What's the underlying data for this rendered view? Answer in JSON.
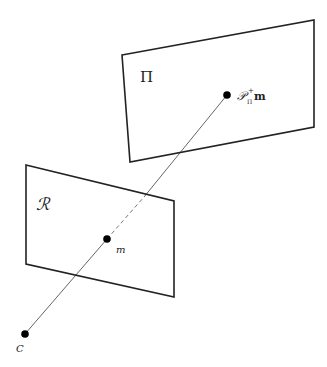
{
  "diagram": {
    "planes": [
      {
        "id": "pi",
        "label": "Π",
        "corners": [
          [
            122,
            55
          ],
          [
            314,
            20
          ],
          [
            314,
            127
          ],
          [
            130,
            162
          ]
        ],
        "label_pos": [
          140,
          82
        ]
      },
      {
        "id": "r",
        "label": "ℛ",
        "corners": [
          [
            26,
            165
          ],
          [
            174,
            201
          ],
          [
            174,
            297
          ],
          [
            26,
            264
          ]
        ],
        "label_pos": [
          38,
          206
        ]
      }
    ],
    "points": [
      {
        "id": "c",
        "label": "C",
        "pos": [
          25,
          334
        ],
        "label_pos": [
          16,
          352
        ]
      },
      {
        "id": "m",
        "label": "m",
        "pos": [
          107,
          239
        ],
        "label_pos": [
          116,
          252
        ]
      },
      {
        "id": "p",
        "label_main": "𝒫",
        "label_sub": "Π",
        "label_sup": "+",
        "label_tail": "m",
        "pos": [
          227,
          95
        ],
        "label_pos": [
          238,
          99
        ]
      }
    ],
    "line_color": "#222222",
    "ray_color": "#666666"
  }
}
